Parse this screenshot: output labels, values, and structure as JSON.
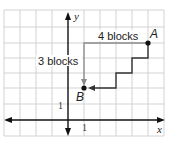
{
  "diagram": {
    "type": "coordinate-grid",
    "grid": {
      "xmin": -4,
      "xmax": 6,
      "ymin": -1,
      "ymax": 7,
      "unit_px": 16
    },
    "axes": {
      "x_label": "x",
      "y_label": "y",
      "x_tick_label": "1",
      "y_tick_label": "1"
    },
    "points": [
      {
        "name": "A",
        "x": 5,
        "y": 5
      },
      {
        "name": "B",
        "x": 1,
        "y": 2
      }
    ],
    "labels": {
      "horizontal_path": "4 blocks",
      "vertical_path": "3 blocks",
      "point_a": "A",
      "point_b": "B"
    },
    "paths": [
      {
        "name": "blocks-path",
        "color": "#888888",
        "points": [
          [
            5,
            5
          ],
          [
            1,
            5
          ],
          [
            1,
            2
          ]
        ]
      },
      {
        "name": "staircase-path",
        "color": "#333333",
        "points": [
          [
            5,
            5
          ],
          [
            5,
            4
          ],
          [
            4,
            4
          ],
          [
            4,
            3
          ],
          [
            3,
            3
          ],
          [
            3,
            2
          ],
          [
            1,
            2
          ]
        ]
      }
    ],
    "colors": {
      "grid": "#c8c8c8",
      "axis": "#111111",
      "path_gray": "#8a8a8a",
      "path_dark": "#333333"
    }
  }
}
